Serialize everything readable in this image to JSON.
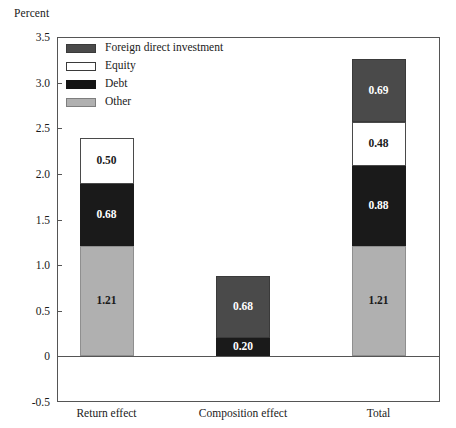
{
  "chart_data": {
    "type": "bar",
    "subtype": "stacked-bar",
    "title": "",
    "xlabel": "",
    "ylabel": "Percent",
    "ylim": [
      -0.5,
      3.5
    ],
    "ytick_labels": [
      "3.5",
      "3.0",
      "2.5",
      "2.0",
      "1.5",
      "1.0",
      "0.5",
      "0",
      "-0.5"
    ],
    "ytick_values": [
      3.5,
      3.0,
      2.5,
      2.0,
      1.5,
      1.0,
      0.5,
      0,
      -0.5
    ],
    "grid": false,
    "legend_position": "top-left",
    "categories": [
      "Return effect",
      "Composition effect",
      "Total"
    ],
    "series": [
      {
        "name": "Foreign direct investment",
        "color": "#4a4a4a",
        "values": [
          null,
          0.68,
          0.69
        ],
        "labels": [
          "",
          "0.68",
          "0.69"
        ]
      },
      {
        "name": "Equity",
        "color": "#ffffff",
        "values": [
          0.5,
          null,
          0.48
        ],
        "labels": [
          "0.50",
          "",
          "0.48"
        ]
      },
      {
        "name": "Debt",
        "color": "#1a1a1a",
        "values": [
          0.68,
          0.2,
          0.88
        ],
        "labels": [
          "0.68",
          "0.20",
          "0.88"
        ]
      },
      {
        "name": "Other",
        "color": "#b0b0b0",
        "values": [
          1.21,
          null,
          1.21
        ],
        "labels": [
          "1.21",
          "",
          "1.21"
        ]
      }
    ],
    "bars": [
      {
        "category": "Return effect",
        "total": 2.39,
        "stack_bottom_to_top": [
          {
            "series": "Other",
            "value": 1.21,
            "label": "1.21",
            "color": "#b0b0b0"
          },
          {
            "series": "Debt",
            "value": 0.68,
            "label": "0.68",
            "color": "#1a1a1a"
          },
          {
            "series": "Equity",
            "value": 0.5,
            "label": "0.50",
            "color": "#ffffff"
          }
        ]
      },
      {
        "category": "Composition effect",
        "total": 0.88,
        "stack_bottom_to_top": [
          {
            "series": "Debt",
            "value": 0.2,
            "label": "0.20",
            "color": "#1a1a1a"
          },
          {
            "series": "Foreign direct investment",
            "value": 0.68,
            "label": "0.68",
            "color": "#4a4a4a"
          }
        ]
      },
      {
        "category": "Total",
        "total": 3.26,
        "stack_bottom_to_top": [
          {
            "series": "Other",
            "value": 1.21,
            "label": "1.21",
            "color": "#b0b0b0"
          },
          {
            "series": "Debt",
            "value": 0.88,
            "label": "0.88",
            "color": "#1a1a1a"
          },
          {
            "series": "Equity",
            "value": 0.48,
            "label": "0.48",
            "color": "#ffffff"
          },
          {
            "series": "Foreign direct investment",
            "value": 0.69,
            "label": "0.69",
            "color": "#4a4a4a"
          }
        ]
      }
    ]
  },
  "legend": {
    "items": [
      {
        "label": "Foreign direct investment",
        "swatch": "c-fdi"
      },
      {
        "label": "Equity",
        "swatch": "c-equity"
      },
      {
        "label": "Debt",
        "swatch": "c-debt"
      },
      {
        "label": "Other",
        "swatch": "c-other"
      }
    ]
  },
  "axis": {
    "unit_label": "Percent"
  }
}
